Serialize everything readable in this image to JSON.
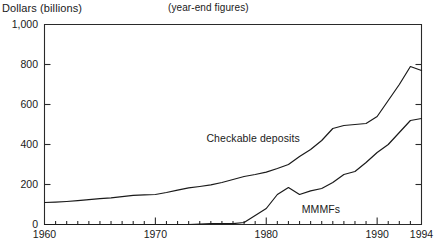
{
  "header": {
    "axis_title": "Dollars (billions)",
    "subtitle": "(year-end figures)"
  },
  "chart_data": {
    "type": "line",
    "title": "Dollars (billions)",
    "subtitle": "(year-end figures)",
    "xlabel": "",
    "ylabel": "Dollars (billions)",
    "xlim": [
      1960,
      1994
    ],
    "ylim": [
      0,
      1000
    ],
    "grid": false,
    "legend": "inline-annotations",
    "y_ticks": [
      0,
      200,
      400,
      600,
      800,
      1000
    ],
    "y_tick_labels": [
      "0",
      "200",
      "400",
      "600",
      "800",
      "1,000"
    ],
    "x_ticks_major": [
      1960,
      1970,
      1980,
      1990,
      1994
    ],
    "x_tick_labels": [
      "1960",
      "1970",
      "1980",
      "1990",
      "1994"
    ],
    "x_minor_tick_interval": 1,
    "x": [
      1960,
      1961,
      1962,
      1963,
      1964,
      1965,
      1966,
      1967,
      1968,
      1969,
      1970,
      1971,
      1972,
      1973,
      1974,
      1975,
      1976,
      1977,
      1978,
      1979,
      1980,
      1981,
      1982,
      1983,
      1984,
      1985,
      1986,
      1987,
      1988,
      1989,
      1990,
      1991,
      1992,
      1993,
      1994
    ],
    "series": [
      {
        "name": "Checkable deposits",
        "label": "Checkable deposits",
        "label_x": 1974.6,
        "label_y": 430,
        "color": "#1a1a1a",
        "values": [
          110,
          112,
          115,
          119,
          124,
          129,
          133,
          139,
          146,
          148,
          150,
          160,
          172,
          183,
          190,
          198,
          210,
          225,
          240,
          250,
          262,
          280,
          300,
          340,
          375,
          420,
          480,
          495,
          500,
          505,
          540,
          620,
          700,
          790,
          770
        ]
      },
      {
        "name": "MMMFs",
        "label": "MMMFs",
        "label_x": 1983.2,
        "label_y": 75,
        "color": "#1a1a1a",
        "values": [
          0,
          0,
          0,
          0,
          0,
          0,
          0,
          0,
          0,
          0,
          0,
          0,
          0,
          0,
          2,
          4,
          4,
          4,
          10,
          45,
          80,
          150,
          185,
          150,
          168,
          180,
          210,
          250,
          265,
          310,
          360,
          400,
          460,
          520,
          530
        ]
      }
    ]
  }
}
